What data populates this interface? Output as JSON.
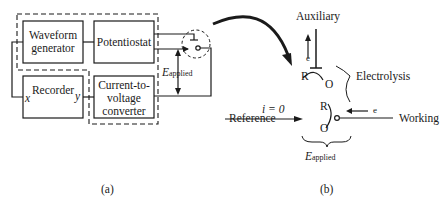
{
  "panel_a": {
    "label": "(a)",
    "blocks": {
      "waveform_generator": [
        "Waveform",
        "generator"
      ],
      "potentiostat": "Potentiostat",
      "recorder": "Recorder",
      "converter": [
        "Current-to-",
        "voltage",
        "converter"
      ]
    },
    "recorder_inputs": {
      "x": "x",
      "y": "y"
    },
    "applied_potential": {
      "symbol": "E",
      "subscript": "applied"
    }
  },
  "panel_b": {
    "label": "(b)",
    "electrodes": {
      "auxiliary": "Auxiliary",
      "reference": "Reference",
      "working": "Working"
    },
    "reference_current": "i = 0",
    "electrolysis_label": "Electrolysis",
    "electron": "e",
    "species": {
      "reduced": "R",
      "oxidized": "O"
    },
    "applied_potential": {
      "symbol": "E",
      "subscript": "applied"
    }
  },
  "colors": {
    "ink": "#1a1a1a",
    "background": "#ffffff"
  }
}
